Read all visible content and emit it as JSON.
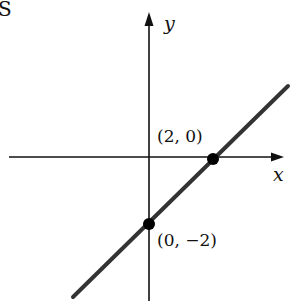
{
  "corner_text": "S",
  "axes": {
    "x_label": "x",
    "y_label": "y"
  },
  "points": [
    {
      "label": "(2, 0)",
      "x": 2,
      "y": 0
    },
    {
      "label": "(0, −2)",
      "x": 0,
      "y": -2
    }
  ],
  "line": {
    "equation": "y = x - 2",
    "color": "#333333"
  },
  "colors": {
    "axis": "#111111",
    "line": "#333333",
    "point": "#000000"
  }
}
